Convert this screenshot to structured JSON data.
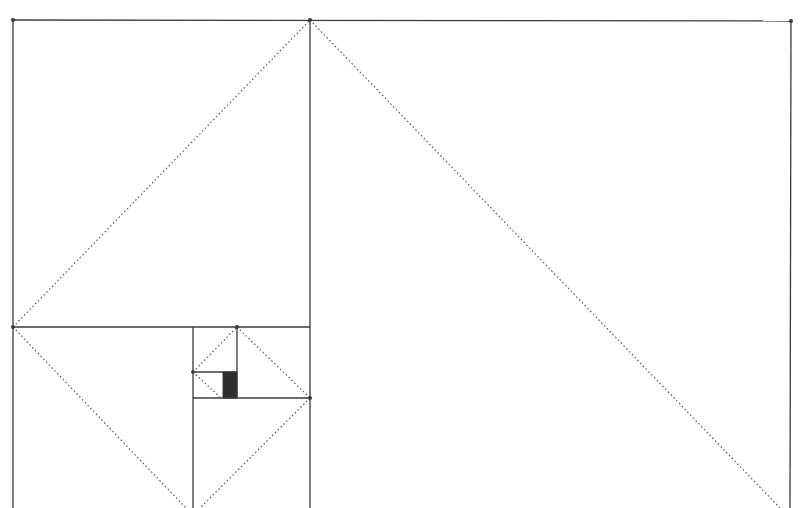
{
  "drawing": {
    "subject": "Golden rectangle subdivision sketch (pencil)",
    "colors": {
      "background": "#ffffff",
      "line": "#3a3a3a",
      "dotted": "#555555",
      "fill": "#2e2e2e"
    },
    "solid_lines": [
      {
        "id": "top-edge",
        "x1": 13,
        "y1": 20,
        "x2": 792,
        "y2": 21
      },
      {
        "id": "left-edge",
        "x1": 13,
        "y1": 20,
        "x2": 13,
        "y2": 508
      },
      {
        "id": "right-edge",
        "x1": 791,
        "y1": 21,
        "x2": 790,
        "y2": 508
      },
      {
        "id": "main-divider",
        "x1": 310,
        "y1": 20,
        "x2": 310,
        "y2": 508
      },
      {
        "id": "square-divider",
        "x1": 13,
        "y1": 327,
        "x2": 310,
        "y2": 327
      },
      {
        "id": "sub-vertical",
        "x1": 193,
        "y1": 327,
        "x2": 193,
        "y2": 508
      },
      {
        "id": "sub-horizontal",
        "x1": 193,
        "y1": 398,
        "x2": 310,
        "y2": 398
      },
      {
        "id": "inner-vertical",
        "x1": 237,
        "y1": 327,
        "x2": 237,
        "y2": 398
      },
      {
        "id": "inner-horizontal",
        "x1": 193,
        "y1": 372,
        "x2": 237,
        "y2": 372
      }
    ],
    "dotted_lines": [
      {
        "id": "diag-a",
        "x1": 13,
        "y1": 327,
        "x2": 310,
        "y2": 20
      },
      {
        "id": "diag-b",
        "x1": 310,
        "y1": 20,
        "x2": 780,
        "y2": 508
      },
      {
        "id": "diag-c",
        "x1": 13,
        "y1": 327,
        "x2": 186,
        "y2": 508
      },
      {
        "id": "diag-d",
        "x1": 310,
        "y1": 398,
        "x2": 200,
        "y2": 508
      },
      {
        "id": "diag-e",
        "x1": 193,
        "y1": 372,
        "x2": 237,
        "y2": 327
      },
      {
        "id": "diag-f",
        "x1": 237,
        "y1": 327,
        "x2": 310,
        "y2": 398
      },
      {
        "id": "diag-g",
        "x1": 193,
        "y1": 372,
        "x2": 221,
        "y2": 398
      }
    ],
    "vertices": [
      {
        "x": 310,
        "y": 20
      },
      {
        "x": 13,
        "y": 327
      },
      {
        "x": 237,
        "y": 327
      },
      {
        "x": 310,
        "y": 398
      },
      {
        "x": 193,
        "y": 372
      },
      {
        "x": 13,
        "y": 20
      },
      {
        "x": 791,
        "y": 21
      }
    ],
    "shaded_rect": {
      "x": 223,
      "y": 372,
      "w": 14,
      "h": 26
    }
  }
}
